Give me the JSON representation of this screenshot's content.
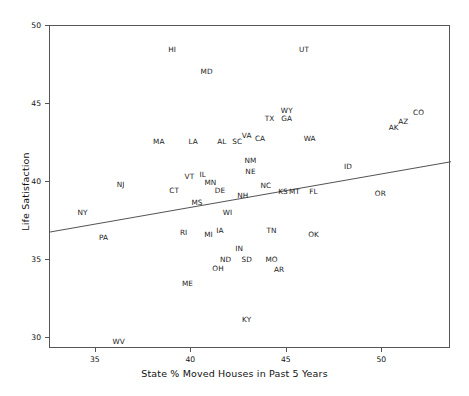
{
  "chart_data": {
    "type": "scatter",
    "title": "",
    "xlabel": "State % Moved Houses in Past 5 Years",
    "ylabel": "Life Satisfaction",
    "xlim": [
      32.6,
      53.6
    ],
    "ylim": [
      29.3,
      50.0
    ],
    "xticks": [
      35,
      40,
      45,
      50
    ],
    "yticks": [
      30,
      35,
      40,
      45,
      50
    ],
    "grid": false,
    "legend": null,
    "point_label_mode": "text-abbreviation",
    "trend_line": {
      "type": "linear-fit",
      "x_start": 32.6,
      "y_start": 36.8,
      "x_end": 53.6,
      "y_end": 41.3,
      "color": "#555555"
    },
    "points": [
      {
        "label": "HI",
        "x": 39.0,
        "y": 48.5
      },
      {
        "label": "UT",
        "x": 45.9,
        "y": 48.5
      },
      {
        "label": "MD",
        "x": 40.8,
        "y": 47.1
      },
      {
        "label": "WY",
        "x": 45.0,
        "y": 44.6
      },
      {
        "label": "GA",
        "x": 45.0,
        "y": 44.1
      },
      {
        "label": "TX",
        "x": 44.1,
        "y": 44.1
      },
      {
        "label": "CO",
        "x": 51.9,
        "y": 44.5
      },
      {
        "label": "AZ",
        "x": 51.1,
        "y": 43.9
      },
      {
        "label": "AK",
        "x": 50.6,
        "y": 43.5
      },
      {
        "label": "VA",
        "x": 42.9,
        "y": 43.0
      },
      {
        "label": "CA",
        "x": 43.6,
        "y": 42.8
      },
      {
        "label": "WA",
        "x": 46.2,
        "y": 42.8
      },
      {
        "label": "MA",
        "x": 38.3,
        "y": 42.6
      },
      {
        "label": "LA",
        "x": 40.1,
        "y": 42.6
      },
      {
        "label": "AL",
        "x": 41.6,
        "y": 42.6
      },
      {
        "label": "SC",
        "x": 42.4,
        "y": 42.6
      },
      {
        "label": "NM",
        "x": 43.1,
        "y": 41.4
      },
      {
        "label": "NE",
        "x": 43.1,
        "y": 40.7
      },
      {
        "label": "ID",
        "x": 48.2,
        "y": 41.0
      },
      {
        "label": "VT",
        "x": 39.9,
        "y": 40.4
      },
      {
        "label": "IL",
        "x": 40.6,
        "y": 40.5
      },
      {
        "label": "MN",
        "x": 41.0,
        "y": 40.0
      },
      {
        "label": "NJ",
        "x": 36.3,
        "y": 39.9
      },
      {
        "label": "CT",
        "x": 39.1,
        "y": 39.5
      },
      {
        "label": "DE",
        "x": 41.5,
        "y": 39.5
      },
      {
        "label": "NC",
        "x": 43.9,
        "y": 39.8
      },
      {
        "label": "KS",
        "x": 44.8,
        "y": 39.4
      },
      {
        "label": "MT",
        "x": 45.4,
        "y": 39.4
      },
      {
        "label": "FL",
        "x": 46.4,
        "y": 39.4
      },
      {
        "label": "NH",
        "x": 42.7,
        "y": 39.2
      },
      {
        "label": "OR",
        "x": 49.9,
        "y": 39.3
      },
      {
        "label": "MS",
        "x": 40.3,
        "y": 38.7
      },
      {
        "label": "NY",
        "x": 34.3,
        "y": 38.1
      },
      {
        "label": "WI",
        "x": 41.9,
        "y": 38.1
      },
      {
        "label": "PA",
        "x": 35.4,
        "y": 36.5
      },
      {
        "label": "RI",
        "x": 39.6,
        "y": 36.8
      },
      {
        "label": "MI",
        "x": 40.9,
        "y": 36.7
      },
      {
        "label": "IA",
        "x": 41.5,
        "y": 36.9
      },
      {
        "label": "TN",
        "x": 44.2,
        "y": 36.9
      },
      {
        "label": "OK",
        "x": 46.4,
        "y": 36.7
      },
      {
        "label": "IN",
        "x": 42.5,
        "y": 35.8
      },
      {
        "label": "ND",
        "x": 41.8,
        "y": 35.1
      },
      {
        "label": "SD",
        "x": 42.9,
        "y": 35.1
      },
      {
        "label": "MO",
        "x": 44.2,
        "y": 35.1
      },
      {
        "label": "OH",
        "x": 41.4,
        "y": 34.5
      },
      {
        "label": "AR",
        "x": 44.6,
        "y": 34.4
      },
      {
        "label": "ME",
        "x": 39.8,
        "y": 33.5
      },
      {
        "label": "KY",
        "x": 42.9,
        "y": 31.2
      },
      {
        "label": "WV",
        "x": 36.2,
        "y": 29.8
      }
    ]
  }
}
